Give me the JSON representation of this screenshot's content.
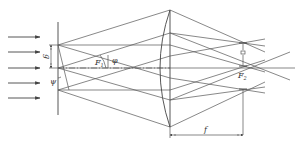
{
  "diagram": {
    "type": "optics-ray-diagram",
    "labels": {
      "grating_period": "g",
      "angle_left": "ψ",
      "angle_right": "φ",
      "focus_1": "F",
      "focus_1_sub": "1",
      "focus_2": "F",
      "focus_2_sub": "2",
      "focal_length": "f"
    },
    "incident_arrows": 5,
    "colors": {
      "line": "#555555",
      "background": "#ffffff"
    }
  }
}
